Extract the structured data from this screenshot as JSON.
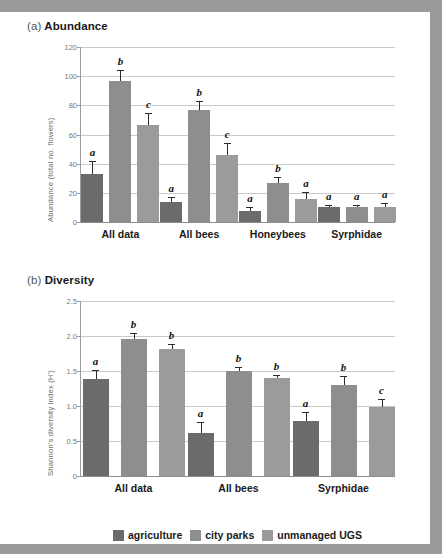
{
  "figure": {
    "background_color": "#9a9a9a",
    "page_color": "#ffffff"
  },
  "panels": [
    {
      "key": "a",
      "prefix": "(a)",
      "title": "Abundance"
    },
    {
      "key": "b",
      "prefix": "(b)",
      "title": "Diversity"
    }
  ],
  "legend": {
    "items": [
      {
        "label": "agriculture",
        "color": "#6b6b6b"
      },
      {
        "label": "city parks",
        "color": "#8e8e8e"
      },
      {
        "label": "unmanaged UGS",
        "color": "#9b9b9b"
      }
    ]
  },
  "chart_data": [
    {
      "type": "bar",
      "id": "abundance",
      "title": "(a) Abundance",
      "xlabel": "",
      "ylabel": "Abundance (total no. flowers)",
      "ylim": [
        0,
        120
      ],
      "yticks": [
        0,
        20,
        40,
        60,
        80,
        100,
        120
      ],
      "ytick_labels": [
        "0",
        "20",
        "40",
        "60",
        "80",
        "100",
        "120"
      ],
      "grid": true,
      "legend_position": "bottom",
      "categories": [
        "All data",
        "All bees",
        "Honeybees",
        "Syrphidae"
      ],
      "series": [
        {
          "name": "agriculture",
          "color": "#6b6b6b",
          "values": [
            33,
            14,
            7.5,
            10
          ],
          "errors": [
            8.5,
            3,
            2.5,
            2
          ],
          "letters": [
            "a",
            "a",
            "a",
            "a"
          ]
        },
        {
          "name": "city parks",
          "color": "#8e8e8e",
          "values": [
            96.5,
            77,
            26.5,
            10.5
          ],
          "errors": [
            8,
            6,
            4.5,
            1.5
          ],
          "letters": [
            "b",
            "b",
            "b",
            "a"
          ]
        },
        {
          "name": "unmanaged UGS",
          "color": "#9b9b9b",
          "values": [
            66.5,
            46,
            16,
            10
          ],
          "errors": [
            8,
            8,
            4.5,
            3
          ],
          "letters": [
            "c",
            "c",
            "a",
            "a"
          ]
        }
      ]
    },
    {
      "type": "bar",
      "id": "diversity",
      "title": "(b) Diversity",
      "xlabel": "",
      "ylabel": "Shannon's diversity index (H')",
      "ylim": [
        0,
        2.5
      ],
      "yticks": [
        0,
        0.5,
        1.0,
        1.5,
        2.0,
        2.5
      ],
      "ytick_labels": [
        "0",
        "0.5",
        "1.0",
        "1.5",
        "2.0",
        "2.5"
      ],
      "grid": true,
      "legend_position": "bottom",
      "categories": [
        "All data",
        "All bees",
        "Syrphidae"
      ],
      "series": [
        {
          "name": "agriculture",
          "color": "#6b6b6b",
          "values": [
            1.38,
            0.62,
            0.79
          ],
          "errors": [
            0.13,
            0.15,
            0.13
          ],
          "letters": [
            "a",
            "a",
            "a"
          ]
        },
        {
          "name": "city parks",
          "color": "#8e8e8e",
          "values": [
            1.96,
            1.5,
            1.3
          ],
          "errors": [
            0.08,
            0.06,
            0.13
          ],
          "letters": [
            "b",
            "b",
            "b"
          ]
        },
        {
          "name": "unmanaged UGS",
          "color": "#9b9b9b",
          "values": [
            1.82,
            1.4,
            0.99
          ],
          "errors": [
            0.06,
            0.04,
            0.11
          ],
          "letters": [
            "b",
            "b",
            "c"
          ]
        }
      ]
    }
  ]
}
